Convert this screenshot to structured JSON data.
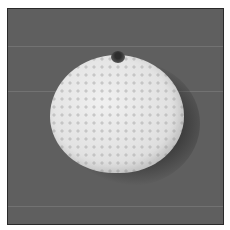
{
  "image": {
    "description": "Grayscale photograph of a round white textured object with a small notch at the top, on a gray background",
    "colors": {
      "background": "#5f5f5f",
      "object": "#e2e2e2",
      "border": "#2a2a2a",
      "margin": "#ffffff"
    }
  }
}
